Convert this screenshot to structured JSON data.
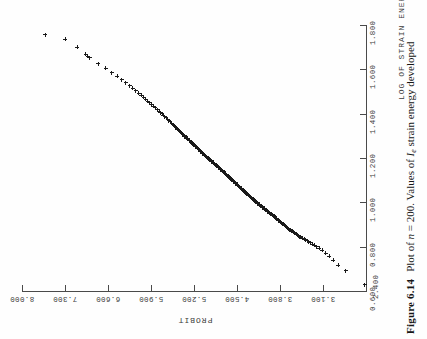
{
  "figure": {
    "number_label": "Figure 6.14",
    "caption_prefix": "Plot of ",
    "caption_n_symbol": "n",
    "caption_n_value": " = 200. Values of ",
    "caption_i_symbol": "I",
    "caption_i_subscript": "e",
    "caption_suffix": " strain energy developed"
  },
  "chart_data": {
    "type": "scatter",
    "xlabel": "LOG OF STRAIN ENERGY",
    "ylabel": "PROBIT",
    "xlim": [
      0.6,
      1.8
    ],
    "ylim": [
      2.4,
      8.0
    ],
    "grid": false,
    "legend": "none",
    "marker": "plus",
    "n_points": 200,
    "xticks": [
      "0.600",
      "0.800",
      "1.000",
      "1.200",
      "1.400",
      "1.600",
      "1.800"
    ],
    "xtick_values": [
      0.6,
      0.8,
      1.0,
      1.2,
      1.4,
      1.6,
      1.8
    ],
    "yticks": [
      "2.400",
      "3.100",
      "3.800",
      "4.500",
      "5.200",
      "5.900",
      "6.600",
      "7.300",
      "8.000"
    ],
    "ytick_values": [
      2.4,
      3.1,
      3.8,
      4.5,
      5.2,
      5.9,
      6.6,
      7.3,
      8.0
    ],
    "note": "Probit (normal quantile) plot of log strain energy; points lie close to a straight line indicating approximate lognormality.",
    "x": [
      0.629,
      0.692,
      0.716,
      0.739,
      0.757,
      0.771,
      0.783,
      0.793,
      0.8,
      0.806,
      0.812,
      0.817,
      0.822,
      0.827,
      0.831,
      0.835,
      0.839,
      0.842,
      0.846,
      0.85,
      0.853,
      0.857,
      0.861,
      0.865,
      0.869,
      0.873,
      0.877,
      0.881,
      0.885,
      0.889,
      0.893,
      0.897,
      0.901,
      0.905,
      0.909,
      0.913,
      0.917,
      0.921,
      0.925,
      0.929,
      0.933,
      0.937,
      0.94,
      0.943,
      0.946,
      0.949,
      0.952,
      0.955,
      0.958,
      0.961,
      0.964,
      0.967,
      0.97,
      0.973,
      0.976,
      0.979,
      0.982,
      0.985,
      0.988,
      0.991,
      0.994,
      0.997,
      1.0,
      1.003,
      1.006,
      1.009,
      1.012,
      1.015,
      1.018,
      1.021,
      1.024,
      1.027,
      1.03,
      1.033,
      1.036,
      1.039,
      1.042,
      1.045,
      1.048,
      1.051,
      1.054,
      1.057,
      1.06,
      1.063,
      1.066,
      1.069,
      1.072,
      1.075,
      1.078,
      1.081,
      1.084,
      1.087,
      1.09,
      1.093,
      1.096,
      1.099,
      1.102,
      1.105,
      1.108,
      1.111,
      1.114,
      1.117,
      1.12,
      1.123,
      1.126,
      1.129,
      1.132,
      1.135,
      1.138,
      1.141,
      1.144,
      1.147,
      1.15,
      1.153,
      1.156,
      1.159,
      1.162,
      1.165,
      1.168,
      1.171,
      1.174,
      1.177,
      1.18,
      1.183,
      1.186,
      1.189,
      1.192,
      1.195,
      1.198,
      1.201,
      1.205,
      1.209,
      1.213,
      1.217,
      1.221,
      1.225,
      1.229,
      1.233,
      1.237,
      1.241,
      1.245,
      1.249,
      1.253,
      1.257,
      1.261,
      1.265,
      1.269,
      1.273,
      1.277,
      1.281,
      1.285,
      1.289,
      1.293,
      1.297,
      1.301,
      1.306,
      1.311,
      1.316,
      1.321,
      1.326,
      1.331,
      1.336,
      1.341,
      1.346,
      1.351,
      1.357,
      1.363,
      1.369,
      1.375,
      1.381,
      1.387,
      1.393,
      1.399,
      1.405,
      1.412,
      1.419,
      1.426,
      1.433,
      1.441,
      1.449,
      1.457,
      1.465,
      1.474,
      1.483,
      1.493,
      1.503,
      1.514,
      1.526,
      1.539,
      1.553,
      1.568,
      1.585,
      1.604,
      1.626,
      1.652,
      1.66,
      1.668,
      1.7,
      1.736,
      1.757
    ],
    "y": [
      2.42,
      2.73,
      2.85,
      2.93,
      3.0,
      3.06,
      3.11,
      3.16,
      3.2,
      3.24,
      3.27,
      3.3,
      3.33,
      3.36,
      3.39,
      3.41,
      3.44,
      3.46,
      3.48,
      3.5,
      3.52,
      3.54,
      3.56,
      3.58,
      3.6,
      3.62,
      3.64,
      3.66,
      3.68,
      3.7,
      3.71,
      3.73,
      3.75,
      3.77,
      3.78,
      3.8,
      3.82,
      3.83,
      3.85,
      3.86,
      3.88,
      3.89,
      3.91,
      3.92,
      3.94,
      3.95,
      3.97,
      3.98,
      4.0,
      4.01,
      4.02,
      4.04,
      4.05,
      4.06,
      4.08,
      4.09,
      4.1,
      4.12,
      4.13,
      4.14,
      4.16,
      4.17,
      4.18,
      4.19,
      4.21,
      4.22,
      4.23,
      4.24,
      4.26,
      4.27,
      4.28,
      4.29,
      4.3,
      4.32,
      4.33,
      4.34,
      4.35,
      4.36,
      4.38,
      4.39,
      4.4,
      4.41,
      4.42,
      4.43,
      4.45,
      4.46,
      4.47,
      4.48,
      4.49,
      4.5,
      4.52,
      4.53,
      4.54,
      4.55,
      4.56,
      4.57,
      4.58,
      4.6,
      4.61,
      4.62,
      4.63,
      4.64,
      4.65,
      4.67,
      4.68,
      4.69,
      4.7,
      4.71,
      4.72,
      4.74,
      4.75,
      4.76,
      4.77,
      4.78,
      4.8,
      4.81,
      4.82,
      4.83,
      4.84,
      4.86,
      4.87,
      4.88,
      4.89,
      4.91,
      4.92,
      4.93,
      4.94,
      4.96,
      4.97,
      4.98,
      5.0,
      5.01,
      5.03,
      5.04,
      5.06,
      5.07,
      5.09,
      5.1,
      5.12,
      5.13,
      5.15,
      5.16,
      5.18,
      5.19,
      5.21,
      5.22,
      5.24,
      5.25,
      5.27,
      5.28,
      5.3,
      5.31,
      5.33,
      5.35,
      5.36,
      5.38,
      5.4,
      5.42,
      5.43,
      5.45,
      5.47,
      5.49,
      5.51,
      5.52,
      5.54,
      5.56,
      5.59,
      5.61,
      5.63,
      5.65,
      5.68,
      5.7,
      5.72,
      5.75,
      5.77,
      5.8,
      5.83,
      5.86,
      5.89,
      5.92,
      5.95,
      5.99,
      6.02,
      6.06,
      6.1,
      6.15,
      6.2,
      6.25,
      6.31,
      6.38,
      6.45,
      6.54,
      6.64,
      6.76,
      6.9,
      6.93,
      6.96,
      7.1,
      7.3,
      7.62
    ]
  }
}
